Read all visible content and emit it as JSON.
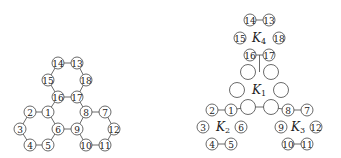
{
  "left_graph": {
    "nodes": [
      {
        "id": "14",
        "label": "14",
        "x": 58,
        "y": 63
      },
      {
        "id": "13",
        "label": "13",
        "x": 77,
        "y": 63
      },
      {
        "id": "15",
        "label": "15",
        "x": 48,
        "y": 80
      },
      {
        "id": "18",
        "label": "18",
        "x": 86,
        "y": 80
      },
      {
        "id": "16",
        "label": "16",
        "x": 58,
        "y": 97
      },
      {
        "id": "17",
        "label": "17",
        "x": 77,
        "y": 97
      },
      {
        "id": "2",
        "label": "2",
        "x": 30,
        "y": 112
      },
      {
        "id": "1",
        "label": "1",
        "x": 48,
        "y": 112
      },
      {
        "id": "8",
        "label": "8",
        "x": 86,
        "y": 112
      },
      {
        "id": "7",
        "label": "7",
        "x": 105,
        "y": 112
      },
      {
        "id": "3",
        "label": "3",
        "x": 20,
        "y": 129
      },
      {
        "id": "6",
        "label": "6",
        "x": 58,
        "y": 129
      },
      {
        "id": "9",
        "label": "9",
        "x": 77,
        "y": 129
      },
      {
        "id": "12",
        "label": "12",
        "x": 114,
        "y": 129
      },
      {
        "id": "4",
        "label": "4",
        "x": 30,
        "y": 145
      },
      {
        "id": "5",
        "label": "5",
        "x": 48,
        "y": 145
      },
      {
        "id": "10",
        "label": "10",
        "x": 86,
        "y": 145
      },
      {
        "id": "11",
        "label": "11",
        "x": 105,
        "y": 145
      }
    ],
    "edges": [
      [
        "14",
        "13"
      ],
      [
        "14",
        "15"
      ],
      [
        "13",
        "18"
      ],
      [
        "15",
        "16"
      ],
      [
        "18",
        "17"
      ],
      [
        "16",
        "17"
      ],
      [
        "2",
        "1"
      ],
      [
        "2",
        "3"
      ],
      [
        "3",
        "4"
      ],
      [
        "4",
        "5"
      ],
      [
        "5",
        "6"
      ],
      [
        "1",
        "6"
      ],
      [
        "8",
        "7"
      ],
      [
        "7",
        "12"
      ],
      [
        "12",
        "11"
      ],
      [
        "11",
        "10"
      ],
      [
        "10",
        "9"
      ],
      [
        "8",
        "9"
      ],
      [
        "16",
        "1"
      ],
      [
        "17",
        "8"
      ],
      [
        "6",
        "9"
      ]
    ]
  },
  "right_graph": {
    "nodes": [
      {
        "id": "r14",
        "label": "14",
        "x": 250,
        "y": 20
      },
      {
        "id": "r13",
        "label": "13",
        "x": 269,
        "y": 20
      },
      {
        "id": "r15",
        "label": "15",
        "x": 240,
        "y": 38
      },
      {
        "id": "r18",
        "label": "18",
        "x": 279,
        "y": 38
      },
      {
        "id": "r16",
        "label": "16",
        "x": 250,
        "y": 55
      },
      {
        "id": "r17",
        "label": "17",
        "x": 269,
        "y": 55
      },
      {
        "id": "r2",
        "label": "2",
        "x": 212,
        "y": 110
      },
      {
        "id": "r1",
        "label": "1",
        "x": 231,
        "y": 110
      },
      {
        "id": "r8",
        "label": "8",
        "x": 288,
        "y": 110
      },
      {
        "id": "r7",
        "label": "7",
        "x": 307,
        "y": 110
      },
      {
        "id": "r3",
        "label": "3",
        "x": 203,
        "y": 127
      },
      {
        "id": "r6",
        "label": "6",
        "x": 241,
        "y": 127
      },
      {
        "id": "r9",
        "label": "9",
        "x": 281,
        "y": 127
      },
      {
        "id": "r12",
        "label": "12",
        "x": 316,
        "y": 127
      },
      {
        "id": "r4",
        "label": "4",
        "x": 212,
        "y": 144
      },
      {
        "id": "r5",
        "label": "5",
        "x": 231,
        "y": 144
      },
      {
        "id": "r10",
        "label": "10",
        "x": 288,
        "y": 144
      },
      {
        "id": "r11",
        "label": "11",
        "x": 307,
        "y": 144
      }
    ],
    "k1_nodes": [
      {
        "id": "k1a",
        "x": 248,
        "y": 72
      },
      {
        "id": "k1b",
        "x": 271,
        "y": 72
      },
      {
        "id": "k1c",
        "x": 237,
        "y": 90
      },
      {
        "id": "k1d",
        "x": 281,
        "y": 90
      },
      {
        "id": "k1e",
        "x": 248,
        "y": 107
      },
      {
        "id": "k1f",
        "x": 271,
        "y": 107
      }
    ],
    "edges": [
      [
        "r14",
        "r13"
      ],
      [
        "r16",
        "r17"
      ],
      [
        "r2",
        "r1"
      ],
      [
        "r8",
        "r7"
      ],
      [
        "r4",
        "r5"
      ],
      [
        "r10",
        "r11"
      ],
      [
        "k1e",
        "k1f"
      ],
      [
        "r1",
        "k1e"
      ],
      [
        "k1f",
        "r8"
      ]
    ],
    "bridge_line": {
      "x": 259.5,
      "y1": 55,
      "y2": 72
    },
    "labels": [
      {
        "id": "K4",
        "main": "K",
        "sub": "4",
        "x": 259,
        "y": 38
      },
      {
        "id": "K1",
        "main": "K",
        "sub": "1",
        "x": 259,
        "y": 90
      },
      {
        "id": "K2",
        "main": "K",
        "sub": "2",
        "x": 223,
        "y": 127
      },
      {
        "id": "K3",
        "main": "K",
        "sub": "3",
        "x": 298,
        "y": 127
      }
    ]
  }
}
